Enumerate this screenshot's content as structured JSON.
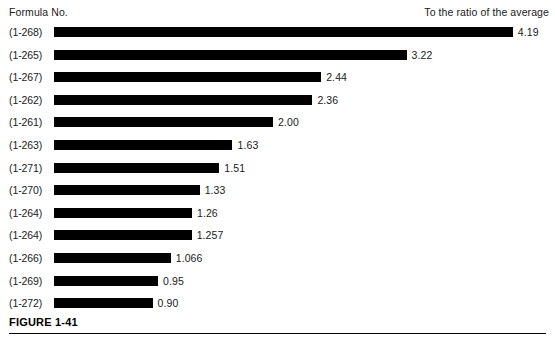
{
  "header": {
    "left_label": "Formula No.",
    "right_label": "To the ratio of the average"
  },
  "caption": {
    "figure_number": "FIGURE 1-41",
    "caption_text": ""
  },
  "chart_data": {
    "type": "bar",
    "orientation": "horizontal",
    "title": "",
    "xlabel": "To the ratio of the average",
    "ylabel": "Formula No.",
    "grid": false,
    "legend": false,
    "bar_color": "#000000",
    "background": "#ffffff",
    "xlim": [
      0,
      4.19
    ],
    "px_per_unit": 109.5,
    "bar_origin_px": 54,
    "categories": [
      "(1-268)",
      "(1-265)",
      "(1-267)",
      "(1-262)",
      "(1-261)",
      "(1-263)",
      "(1-271)",
      "(1-270)",
      "(1-264)",
      "(1-264)",
      "(1-266)",
      "(1-269)",
      "(1-272)"
    ],
    "values": [
      4.19,
      3.22,
      2.44,
      2.36,
      2.0,
      1.63,
      1.51,
      1.33,
      1.26,
      1.257,
      1.066,
      0.95,
      0.9
    ],
    "value_labels": [
      "4.19",
      "3.22",
      "2.44",
      "2.36",
      "2.00",
      "1.63",
      "1.51",
      "1.33",
      "1.26",
      "1.257",
      "1.066",
      "0.95",
      "0.90"
    ]
  }
}
